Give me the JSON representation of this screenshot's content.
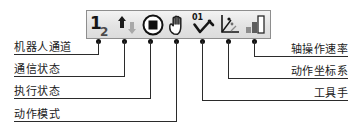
{
  "diagram": {
    "toolbar": {
      "name": "status-toolbar",
      "icons": [
        {
          "id": "robot-channel",
          "name": "robot-channel-icon",
          "glyph_primary": "1",
          "glyph_secondary": "2"
        },
        {
          "id": "comm-status",
          "name": "communication-status-icon",
          "glyph_primary": "▲",
          "glyph_secondary": "▼"
        },
        {
          "id": "exec-status",
          "name": "execution-status-icon",
          "glyph_primary": "■",
          "glyph_secondary": ""
        },
        {
          "id": "action-mode",
          "name": "hand-icon",
          "glyph_primary": "✋",
          "glyph_secondary": ""
        },
        {
          "id": "tool-hand",
          "name": "tool-hand-icon",
          "glyph_primary": "01",
          "glyph_secondary": ""
        },
        {
          "id": "coord-system",
          "name": "coordinate-system-icon",
          "glyph_primary": "⊥",
          "glyph_secondary": ""
        },
        {
          "id": "axis-speed",
          "name": "speed-bars-icon",
          "glyph_primary": "▁▄█",
          "glyph_secondary": ""
        }
      ]
    },
    "callouts_left": [
      {
        "id": "robot-channel",
        "label": "机器人通道"
      },
      {
        "id": "comm-status",
        "label": "通信状态"
      },
      {
        "id": "exec-status",
        "label": "执行状态"
      },
      {
        "id": "action-mode",
        "label": "动作模式"
      }
    ],
    "callouts_right": [
      {
        "id": "axis-speed",
        "label": "轴操作速率"
      },
      {
        "id": "coord-system",
        "label": "动作坐标系"
      },
      {
        "id": "tool-hand",
        "label": "工具手"
      }
    ],
    "colors": {
      "line": "#2b2b2b",
      "dot": "#111111",
      "text": "#1b1b1b",
      "toolbar_bg": "#e6e6e6",
      "toolbar_border": "#8e8e8e",
      "icon_dark": "#1a1a1a",
      "icon_gray": "#9a9a9a"
    }
  }
}
